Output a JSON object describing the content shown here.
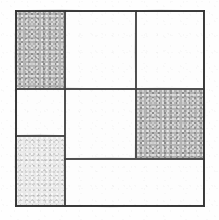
{
  "figure": {
    "canvas": {
      "width": 219,
      "height": 220
    },
    "frame": {
      "x": 15,
      "y": 10,
      "width": 190,
      "height": 197
    },
    "palette": {
      "paper": "#fefefe",
      "ink": "#3a3a3a",
      "frame_ink": "#2e2e2e",
      "shade_mid": "#b4b4b4",
      "shade_light": "#e9e9e9",
      "unshaded": "#fdfdfd"
    },
    "cells": [
      {
        "id": "cell-top-left",
        "label": "A",
        "shade": "shade-mid",
        "x": 16,
        "y": 11,
        "w": 48,
        "h": 77
      },
      {
        "id": "cell-top-middle",
        "label": "B",
        "shade": "shade-none",
        "x": 66,
        "y": 11,
        "w": 69,
        "h": 77
      },
      {
        "id": "cell-top-right",
        "label": "C",
        "shade": "shade-none",
        "x": 137,
        "y": 11,
        "w": 67,
        "h": 77
      },
      {
        "id": "cell-mid-left",
        "label": "D",
        "shade": "shade-none",
        "x": 16,
        "y": 90,
        "w": 48,
        "h": 45
      },
      {
        "id": "cell-center",
        "label": "E",
        "shade": "shade-none",
        "x": 66,
        "y": 90,
        "w": 69,
        "h": 68
      },
      {
        "id": "cell-mid-right",
        "label": "F",
        "shade": "shade-mid",
        "x": 137,
        "y": 90,
        "w": 67,
        "h": 68
      },
      {
        "id": "cell-bottom-left",
        "label": "G",
        "shade": "shade-light",
        "x": 16,
        "y": 137,
        "w": 48,
        "h": 69
      },
      {
        "id": "cell-bottom-right",
        "label": "H",
        "shade": "shade-none",
        "x": 66,
        "y": 160,
        "w": 138,
        "h": 46
      }
    ],
    "dividers": [
      {
        "id": "divider-horizontal-upper",
        "orientation": "horizontal",
        "x": 15,
        "y": 88,
        "length": 190
      },
      {
        "id": "divider-horizontal-left",
        "orientation": "horizontal",
        "x": 15,
        "y": 135,
        "length": 50
      },
      {
        "id": "divider-horizontal-lower",
        "orientation": "horizontal",
        "x": 64,
        "y": 158,
        "length": 141
      },
      {
        "id": "divider-vertical-left",
        "orientation": "vertical",
        "x": 64,
        "y": 10,
        "length": 197
      },
      {
        "id": "divider-vertical-right",
        "orientation": "vertical",
        "x": 135,
        "y": 10,
        "length": 148
      }
    ]
  }
}
